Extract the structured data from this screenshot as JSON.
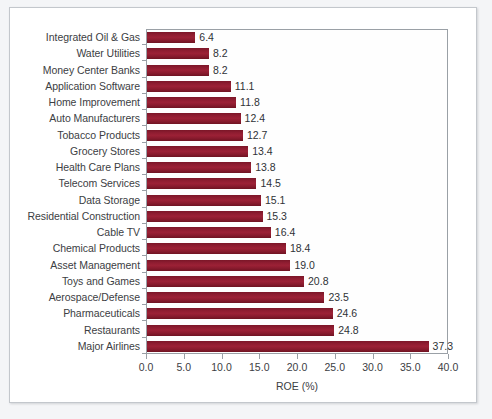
{
  "chart_data": {
    "type": "bar",
    "orientation": "horizontal",
    "title": "",
    "xlabel": "ROE (%)",
    "ylabel": "",
    "xlim": [
      0.0,
      40.0
    ],
    "xticks": [
      "0.0",
      "5.0",
      "10.0",
      "15.0",
      "20.0",
      "25.0",
      "30.0",
      "35.0",
      "40.0"
    ],
    "xtick_values": [
      0,
      5,
      10,
      15,
      20,
      25,
      30,
      35,
      40
    ],
    "grid": false,
    "legend": "none",
    "data_labels": true,
    "bar_color": "#8a1a2e",
    "categories": [
      "Integrated Oil & Gas",
      "Water Utilities",
      "Money Center Banks",
      "Application Software",
      "Home Improvement",
      "Auto Manufacturers",
      "Tobacco Products",
      "Grocery Stores",
      "Health Care Plans",
      "Telecom Services",
      "Data Storage",
      "Residential Construction",
      "Cable TV",
      "Chemical Products",
      "Asset Management",
      "Toys and Games",
      "Aerospace/Defense",
      "Pharmaceuticals",
      "Restaurants",
      "Major Airlines"
    ],
    "values": [
      6.4,
      8.2,
      8.2,
      11.1,
      11.8,
      12.4,
      12.7,
      13.4,
      13.8,
      14.5,
      15.1,
      15.3,
      16.4,
      18.4,
      19.0,
      20.8,
      23.5,
      24.6,
      24.8,
      37.3
    ],
    "value_labels": [
      "6.4",
      "8.2",
      "8.2",
      "11.1",
      "11.8",
      "12.4",
      "12.7",
      "13.4",
      "13.8",
      "14.5",
      "15.1",
      "15.3",
      "16.4",
      "18.4",
      "19.0",
      "20.8",
      "23.5",
      "24.6",
      "24.8",
      "37.3"
    ]
  }
}
